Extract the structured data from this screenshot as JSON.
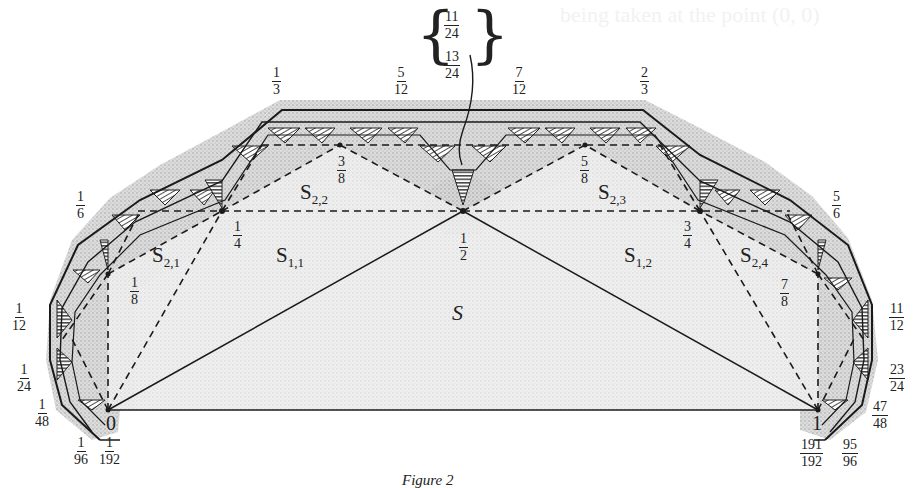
{
  "page": {
    "bleed_text": "being taken at the point (0, 0)",
    "caption": "Figure 2"
  },
  "figure": {
    "type": "geometric construction / polygon subdivision",
    "colors": {
      "ink": "#1a1a1a",
      "stipple": "#bdbdbd",
      "hatch": "#2a2a2a",
      "background": "#ffffff"
    },
    "main_region_label": "S",
    "regions": [
      {
        "id": "S11",
        "base": "S",
        "sub": "1,1"
      },
      {
        "id": "S12",
        "base": "S",
        "sub": "1,2"
      },
      {
        "id": "S21",
        "base": "S",
        "sub": "2,1"
      },
      {
        "id": "S22",
        "base": "S",
        "sub": "2,2"
      },
      {
        "id": "S23",
        "base": "S",
        "sub": "2,3"
      },
      {
        "id": "S24",
        "base": "S",
        "sub": "2,4"
      }
    ],
    "base_points": {
      "left": "0",
      "right": "1"
    },
    "inner_vertex_labels": [
      {
        "num": "1",
        "den": "8"
      },
      {
        "num": "1",
        "den": "4"
      },
      {
        "num": "3",
        "den": "8"
      },
      {
        "num": "1",
        "den": "2"
      },
      {
        "num": "5",
        "den": "8"
      },
      {
        "num": "3",
        "den": "4"
      },
      {
        "num": "7",
        "den": "8"
      }
    ],
    "outer_labels": [
      {
        "num": "1",
        "den": "192"
      },
      {
        "num": "1",
        "den": "96"
      },
      {
        "num": "1",
        "den": "48"
      },
      {
        "num": "1",
        "den": "24"
      },
      {
        "num": "1",
        "den": "12"
      },
      {
        "num": "1",
        "den": "6"
      },
      {
        "num": "1",
        "den": "3"
      },
      {
        "num": "5",
        "den": "12"
      },
      {
        "num": "11",
        "den": "24"
      },
      {
        "num": "13",
        "den": "24"
      },
      {
        "num": "7",
        "den": "12"
      },
      {
        "num": "2",
        "den": "3"
      },
      {
        "num": "5",
        "den": "6"
      },
      {
        "num": "11",
        "den": "12"
      },
      {
        "num": "23",
        "den": "24"
      },
      {
        "num": "47",
        "den": "48"
      },
      {
        "num": "95",
        "den": "96"
      },
      {
        "num": "191",
        "den": "192"
      }
    ]
  }
}
